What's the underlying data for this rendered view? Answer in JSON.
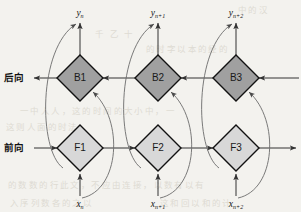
{
  "figure": {
    "type": "diagram",
    "subtype": "bidirectional-recurrent-network-unfolded",
    "background_color": "#f3f2ee",
    "width": 301,
    "height": 212
  },
  "row_labels": {
    "backward": "后向",
    "forward": "前向"
  },
  "colors": {
    "backward_node_fill": "#a0a0a0",
    "forward_node_fill": "#d8d8d8",
    "node_stroke": "#111111",
    "wire": "#333333",
    "curve": "#6b6b6b"
  },
  "nodes": {
    "backward": [
      {
        "id": "B1",
        "label": "B1",
        "cx": 80,
        "cy": 78
      },
      {
        "id": "B2",
        "label": "B2",
        "cx": 158,
        "cy": 78
      },
      {
        "id": "B3",
        "label": "B3",
        "cx": 236,
        "cy": 78
      }
    ],
    "forward": [
      {
        "id": "F1",
        "label": "F1",
        "cx": 80,
        "cy": 148
      },
      {
        "id": "F2",
        "label": "F2",
        "cx": 158,
        "cy": 148
      },
      {
        "id": "F3",
        "label": "F3",
        "cx": 236,
        "cy": 148
      }
    ]
  },
  "outputs": [
    {
      "base": "y",
      "sub": "n",
      "x": 80,
      "y": 16
    },
    {
      "base": "y",
      "sub": "n+1",
      "x": 158,
      "y": 16
    },
    {
      "base": "y",
      "sub": "n+2",
      "x": 236,
      "y": 16
    }
  ],
  "inputs": [
    {
      "base": "x",
      "sub": "n",
      "x": 80,
      "y": 206
    },
    {
      "base": "x",
      "sub": "n+1",
      "x": 158,
      "y": 206
    },
    {
      "base": "x",
      "sub": "n+2",
      "x": 236,
      "y": 206
    }
  ],
  "bleed_text": [
    {
      "text": "中的汉",
      "x": 238,
      "y": 3
    },
    {
      "text": "千   乙  十",
      "x": 95,
      "y": 27
    },
    {
      "text": "的时字以本的经的",
      "x": 146,
      "y": 42
    },
    {
      "text": "一中人人，这的时间的大小中，一",
      "x": 20,
      "y": 104
    },
    {
      "text": "这则人面的时法",
      "x": 6,
      "y": 120
    },
    {
      "text": "的数数的行此文，不应由连接，以数有以有",
      "x": 8,
      "y": 178
    },
    {
      "text": "入序列数各的之以",
      "x": 10,
      "y": 196
    },
    {
      "text": "这和回以和的计",
      "x": 160,
      "y": 196
    }
  ]
}
